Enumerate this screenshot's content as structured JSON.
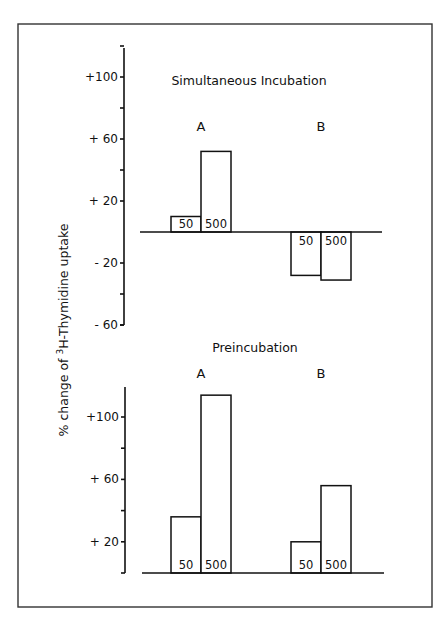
{
  "chart_data": [
    {
      "type": "bar",
      "title": "Simultaneous  Incubation",
      "ylabel": "% change of 3H-Thymidine uptake",
      "xlabel": "",
      "groups": [
        "A",
        "B"
      ],
      "categories": [
        "50",
        "500"
      ],
      "series": [
        {
          "group": "A",
          "values": [
            10,
            52
          ]
        },
        {
          "group": "B",
          "values": [
            -28,
            -31
          ]
        }
      ],
      "yticks": [
        100,
        60,
        20,
        -20,
        -60
      ],
      "ytick_labels": [
        "+100",
        "+ 60",
        "+ 20",
        "- 20",
        "- 60"
      ],
      "ylim": [
        -60,
        120
      ],
      "grid": false,
      "legend": null
    },
    {
      "type": "bar",
      "title": "Preincubation",
      "ylabel": "% change of 3H-Thymidine uptake",
      "xlabel": "",
      "groups": [
        "A",
        "B"
      ],
      "categories": [
        "50",
        "500"
      ],
      "series": [
        {
          "group": "A",
          "values": [
            36,
            114
          ]
        },
        {
          "group": "B",
          "values": [
            20,
            56
          ]
        }
      ],
      "yticks": [
        100,
        60,
        20
      ],
      "ytick_labels": [
        "+100",
        "+ 60",
        "+ 20"
      ],
      "ylim": [
        0,
        120
      ],
      "grid": false,
      "legend": null
    }
  ],
  "figure": {
    "ylabel_prefix": "% change of ",
    "ylabel_sup": "3",
    "ylabel_suffix": "H-Thymidine  uptake"
  }
}
